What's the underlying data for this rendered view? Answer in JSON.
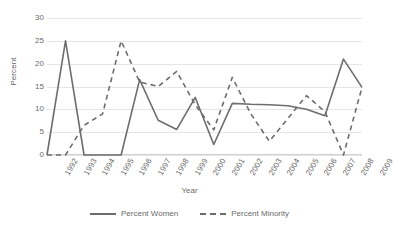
{
  "chart_data": {
    "type": "line",
    "title": "",
    "xlabel": "Year",
    "ylabel": "Percent",
    "ylim": [
      0,
      30
    ],
    "yticks": [
      0,
      5,
      10,
      15,
      20,
      25,
      30
    ],
    "grid": true,
    "legend_position": "bottom",
    "categories": [
      "1992",
      "1993",
      "1994",
      "1995",
      "1996",
      "1997",
      "1998",
      "1999",
      "2000",
      "2001",
      "2002",
      "2003",
      "2004",
      "2005",
      "2006",
      "2007",
      "2008",
      "2009"
    ],
    "series": [
      {
        "name": "Percent Women",
        "style": "solid",
        "color": "#6d6d6d",
        "values": [
          0,
          25,
          0,
          0,
          0,
          16.5,
          7.6,
          5.6,
          12.6,
          2.3,
          11.3,
          11.1,
          11,
          10.8,
          10,
          8.6,
          21,
          14.8
        ]
      },
      {
        "name": "Percent Minority",
        "style": "dashed",
        "color": "#6d6d6d",
        "values": [
          0,
          0,
          6.5,
          9,
          25,
          16,
          15,
          18.3,
          11,
          5.5,
          17,
          9,
          3,
          8,
          13,
          9.5,
          0,
          14.8
        ]
      }
    ]
  },
  "axes": {
    "y_title": "Percent",
    "x_title": "Year",
    "y_tick_labels": [
      "0",
      "5",
      "10",
      "15",
      "20",
      "25",
      "30"
    ],
    "x_tick_labels": [
      "1992",
      "1993",
      "1994",
      "1995",
      "1996",
      "1997",
      "1998",
      "1999",
      "2000",
      "2001",
      "2002",
      "2003",
      "2004",
      "2005",
      "2006",
      "2007",
      "2008",
      "2009"
    ]
  },
  "legend": {
    "items": [
      {
        "label": "Percent Women",
        "style": "solid"
      },
      {
        "label": "Percent Minority",
        "style": "dashed"
      }
    ]
  }
}
